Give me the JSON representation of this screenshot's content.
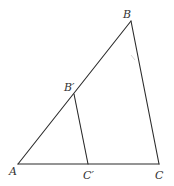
{
  "diagram": {
    "type": "geometry-triangle",
    "points": {
      "A": {
        "label": "A",
        "x": 18,
        "y": 164
      },
      "B": {
        "label": "B",
        "x": 131,
        "y": 21
      },
      "C": {
        "label": "C",
        "x": 159,
        "y": 164
      },
      "Bp": {
        "label": "B′",
        "x": 74,
        "y": 94
      },
      "Cp": {
        "label": "C′",
        "x": 88,
        "y": 164
      }
    },
    "segments": [
      {
        "from": "A",
        "to": "B"
      },
      {
        "from": "B",
        "to": "C"
      },
      {
        "from": "A",
        "to": "C"
      },
      {
        "from": "Bp",
        "to": "Cp"
      }
    ],
    "colors": {
      "line": "#2b2b2b",
      "label": "#333333",
      "background": "#ffffff"
    }
  }
}
